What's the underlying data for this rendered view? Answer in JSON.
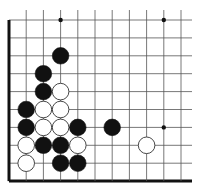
{
  "board": {
    "description": "Go board fragment (lower-left corner region)",
    "columns": 11,
    "rows": 10,
    "origin_x": 9,
    "origin_y": 20,
    "spacing_x": 17.2,
    "spacing_y": 17.9,
    "right_extent": 192,
    "line_color": "#555555",
    "edge_color": "#111111",
    "edges": [
      "left",
      "bottom"
    ],
    "hoshi": [
      {
        "col": 3,
        "row": 0
      },
      {
        "col": 9,
        "row": 0
      },
      {
        "col": 9,
        "row": 6
      }
    ],
    "stones": [
      {
        "color": "black",
        "col": 3,
        "row": 2
      },
      {
        "color": "black",
        "col": 2,
        "row": 3
      },
      {
        "color": "black",
        "col": 2,
        "row": 4
      },
      {
        "color": "white",
        "col": 3,
        "row": 4
      },
      {
        "color": "black",
        "col": 1,
        "row": 5
      },
      {
        "color": "white",
        "col": 2,
        "row": 5
      },
      {
        "color": "white",
        "col": 3,
        "row": 5
      },
      {
        "color": "black",
        "col": 1,
        "row": 6
      },
      {
        "color": "white",
        "col": 2,
        "row": 6
      },
      {
        "color": "white",
        "col": 3,
        "row": 6
      },
      {
        "color": "black",
        "col": 4,
        "row": 6
      },
      {
        "color": "black",
        "col": 6,
        "row": 6
      },
      {
        "color": "white",
        "col": 1,
        "row": 7
      },
      {
        "color": "black",
        "col": 2,
        "row": 7
      },
      {
        "color": "black",
        "col": 3,
        "row": 7
      },
      {
        "color": "white",
        "col": 4,
        "row": 7
      },
      {
        "color": "white",
        "col": 8,
        "row": 7
      },
      {
        "color": "white",
        "col": 1,
        "row": 8
      },
      {
        "color": "black",
        "col": 3,
        "row": 8
      },
      {
        "color": "black",
        "col": 4,
        "row": 8
      }
    ]
  }
}
